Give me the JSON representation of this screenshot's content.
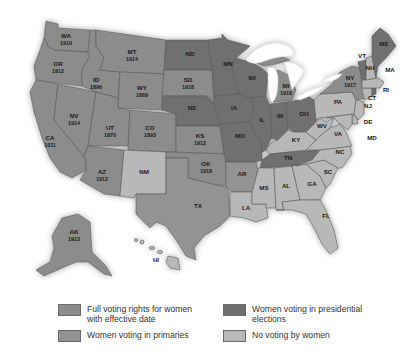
{
  "colors": {
    "full": "#8c8c8c",
    "presidential": "#6f6f6f",
    "primaries": "#939393",
    "none": "#b8b8b8",
    "lake": "#ffffff",
    "border": "#5a5a5a"
  },
  "legend": [
    {
      "key": "full",
      "label": "Full voting rights for women with effective date",
      "line1": "Full voting rights for women",
      "line2": "with effective date"
    },
    {
      "key": "presidential",
      "label": "Women voting in presidential elections",
      "line1": "Women voting in presidential",
      "line2": "elections"
    },
    {
      "key": "primaries",
      "label": "Women voting in primaries",
      "line1": "Women voting in primaries",
      "line2": ""
    },
    {
      "key": "none",
      "label": "No voting by women",
      "line1": "No voting by women",
      "line2": ""
    }
  ],
  "states": {
    "WA": {
      "abbr": "WA",
      "year": "1910",
      "status": "full"
    },
    "OR": {
      "abbr": "OR",
      "year": "1912",
      "status": "full"
    },
    "CA": {
      "abbr": "CA",
      "year": "1911",
      "status": "full"
    },
    "NV": {
      "abbr": "NV",
      "year": "1914",
      "status": "full"
    },
    "ID": {
      "abbr": "ID",
      "year": "1896",
      "status": "full"
    },
    "MT": {
      "abbr": "MT",
      "year": "1914",
      "status": "full"
    },
    "WY": {
      "abbr": "WY",
      "year": "1869",
      "status": "full"
    },
    "UT": {
      "abbr": "UT",
      "year": "1870",
      "status": "full"
    },
    "CO": {
      "abbr": "CO",
      "year": "1893",
      "status": "full"
    },
    "AZ": {
      "abbr": "AZ",
      "year": "1912",
      "status": "full"
    },
    "NM": {
      "abbr": "NM",
      "year": "",
      "status": "none"
    },
    "ND": {
      "abbr": "ND",
      "year": "",
      "status": "presidential"
    },
    "SD": {
      "abbr": "SD",
      "year": "1918",
      "status": "full"
    },
    "NE": {
      "abbr": "NE",
      "year": "",
      "status": "presidential"
    },
    "KS": {
      "abbr": "KS",
      "year": "1912",
      "status": "full"
    },
    "OK": {
      "abbr": "OK",
      "year": "1918",
      "status": "full"
    },
    "TX": {
      "abbr": "TX",
      "year": "",
      "status": "primaries"
    },
    "MN": {
      "abbr": "MN",
      "year": "",
      "status": "presidential"
    },
    "IA": {
      "abbr": "IA",
      "year": "",
      "status": "presidential"
    },
    "MO": {
      "abbr": "MO",
      "year": "",
      "status": "presidential"
    },
    "AR": {
      "abbr": "AR",
      "year": "",
      "status": "primaries"
    },
    "LA": {
      "abbr": "LA",
      "year": "",
      "status": "none"
    },
    "WI": {
      "abbr": "WI",
      "year": "",
      "status": "presidential"
    },
    "IL": {
      "abbr": "IL",
      "year": "",
      "status": "presidential"
    },
    "MI": {
      "abbr": "MI",
      "year": "1918",
      "status": "full"
    },
    "IN": {
      "abbr": "IN",
      "year": "",
      "status": "presidential"
    },
    "OH": {
      "abbr": "OH",
      "year": "",
      "status": "presidential"
    },
    "KY": {
      "abbr": "KY",
      "year": "",
      "status": "none"
    },
    "TN": {
      "abbr": "TN",
      "year": "",
      "status": "presidential"
    },
    "MS": {
      "abbr": "MS",
      "year": "",
      "status": "none"
    },
    "AL": {
      "abbr": "AL",
      "year": "",
      "status": "none"
    },
    "GA": {
      "abbr": "GA",
      "year": "",
      "status": "none"
    },
    "FL": {
      "abbr": "FL",
      "year": "",
      "status": "none"
    },
    "SC": {
      "abbr": "SC",
      "year": "",
      "status": "none"
    },
    "NC": {
      "abbr": "NC",
      "year": "",
      "status": "none"
    },
    "VA": {
      "abbr": "VA",
      "year": "",
      "status": "none"
    },
    "WV": {
      "abbr": "WV",
      "year": "",
      "status": "none"
    },
    "PA": {
      "abbr": "PA",
      "year": "",
      "status": "none"
    },
    "NY": {
      "abbr": "NY",
      "year": "1917",
      "status": "full"
    },
    "VT": {
      "abbr": "VT",
      "year": "",
      "status": "presidential"
    },
    "NH": {
      "abbr": "NH",
      "year": "",
      "status": "none"
    },
    "ME": {
      "abbr": "ME",
      "year": "",
      "status": "presidential"
    },
    "MA": {
      "abbr": "MA",
      "year": "",
      "status": "none"
    },
    "RI": {
      "abbr": "RI",
      "year": "",
      "status": "presidential"
    },
    "CT": {
      "abbr": "CT",
      "year": "",
      "status": "none"
    },
    "NJ": {
      "abbr": "NJ",
      "year": "",
      "status": "none"
    },
    "DE": {
      "abbr": "DE",
      "year": "",
      "status": "none"
    },
    "MD": {
      "abbr": "MD",
      "year": "",
      "status": "none"
    },
    "AK": {
      "abbr": "AK",
      "year": "1913",
      "status": "full"
    },
    "HI": {
      "abbr": "HI",
      "year": "",
      "status": "none"
    }
  }
}
